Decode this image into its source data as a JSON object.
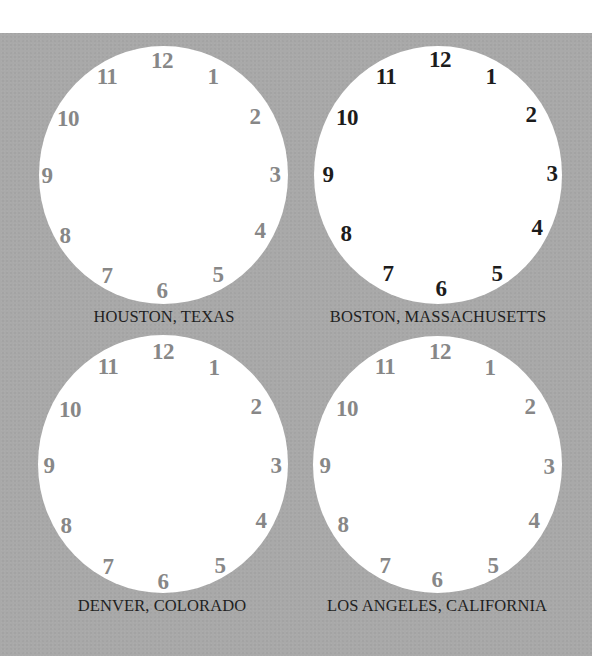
{
  "clocks": [
    {
      "city": "HOUSTON, TEXAS",
      "numeral_style": "gray",
      "face": {
        "left": 39,
        "top": 46,
        "width": 249,
        "height": 258
      },
      "label_pos": {
        "x": 164,
        "y": 309
      },
      "numerals": [
        {
          "text": "12",
          "x": 162,
          "y": 60
        },
        {
          "text": "1",
          "x": 213,
          "y": 76
        },
        {
          "text": "2",
          "x": 255,
          "y": 116
        },
        {
          "text": "3",
          "x": 275,
          "y": 174
        },
        {
          "text": "4",
          "x": 260,
          "y": 230
        },
        {
          "text": "5",
          "x": 218,
          "y": 274
        },
        {
          "text": "6",
          "x": 162,
          "y": 290
        },
        {
          "text": "7",
          "x": 107,
          "y": 275
        },
        {
          "text": "8",
          "x": 65,
          "y": 235
        },
        {
          "text": "9",
          "x": 47,
          "y": 175
        },
        {
          "text": "10",
          "x": 68,
          "y": 118
        },
        {
          "text": "11",
          "x": 107,
          "y": 76
        }
      ]
    },
    {
      "city": "BOSTON, MASSACHUSETTS",
      "numeral_style": "dark",
      "face": {
        "left": 314,
        "top": 46,
        "width": 248,
        "height": 258
      },
      "label_pos": {
        "x": 438,
        "y": 309
      },
      "numerals": [
        {
          "text": "12",
          "x": 440,
          "y": 59
        },
        {
          "text": "1",
          "x": 491,
          "y": 76
        },
        {
          "text": "2",
          "x": 531,
          "y": 114
        },
        {
          "text": "3",
          "x": 552,
          "y": 173
        },
        {
          "text": "4",
          "x": 537,
          "y": 227
        },
        {
          "text": "5",
          "x": 497,
          "y": 273
        },
        {
          "text": "6",
          "x": 441,
          "y": 288
        },
        {
          "text": "7",
          "x": 388,
          "y": 273
        },
        {
          "text": "8",
          "x": 346,
          "y": 233
        },
        {
          "text": "9",
          "x": 328,
          "y": 174
        },
        {
          "text": "10",
          "x": 347,
          "y": 117
        },
        {
          "text": "11",
          "x": 386,
          "y": 76
        }
      ]
    },
    {
      "city": "DENVER, COLORADO",
      "numeral_style": "gray",
      "face": {
        "left": 38,
        "top": 335,
        "width": 250,
        "height": 258
      },
      "label_pos": {
        "x": 162,
        "y": 598
      },
      "numerals": [
        {
          "text": "12",
          "x": 163,
          "y": 351
        },
        {
          "text": "1",
          "x": 214,
          "y": 367
        },
        {
          "text": "2",
          "x": 256,
          "y": 406
        },
        {
          "text": "3",
          "x": 276,
          "y": 465
        },
        {
          "text": "4",
          "x": 261,
          "y": 520
        },
        {
          "text": "5",
          "x": 220,
          "y": 565
        },
        {
          "text": "6",
          "x": 163,
          "y": 581
        },
        {
          "text": "7",
          "x": 108,
          "y": 566
        },
        {
          "text": "8",
          "x": 66,
          "y": 525
        },
        {
          "text": "9",
          "x": 49,
          "y": 465
        },
        {
          "text": "10",
          "x": 70,
          "y": 409
        },
        {
          "text": "11",
          "x": 108,
          "y": 366
        }
      ]
    },
    {
      "city": "LOS ANGELES, CALIFORNIA",
      "numeral_style": "gray",
      "face": {
        "left": 313,
        "top": 336,
        "width": 249,
        "height": 257
      },
      "label_pos": {
        "x": 437,
        "y": 598
      },
      "numerals": [
        {
          "text": "12",
          "x": 440,
          "y": 351
        },
        {
          "text": "1",
          "x": 490,
          "y": 367
        },
        {
          "text": "2",
          "x": 530,
          "y": 406
        },
        {
          "text": "3",
          "x": 549,
          "y": 466
        },
        {
          "text": "4",
          "x": 534,
          "y": 520
        },
        {
          "text": "5",
          "x": 493,
          "y": 565
        },
        {
          "text": "6",
          "x": 437,
          "y": 579
        },
        {
          "text": "7",
          "x": 385,
          "y": 565
        },
        {
          "text": "8",
          "x": 343,
          "y": 524
        },
        {
          "text": "9",
          "x": 325,
          "y": 465
        },
        {
          "text": "10",
          "x": 347,
          "y": 408
        },
        {
          "text": "11",
          "x": 385,
          "y": 366
        }
      ]
    }
  ],
  "colors": {
    "background_panel": "#a9a9a9",
    "clock_face": "#ffffff",
    "numeral_gray": "#878787",
    "numeral_dark": "#1c1c1c",
    "label_text": "#1f1f1f"
  }
}
